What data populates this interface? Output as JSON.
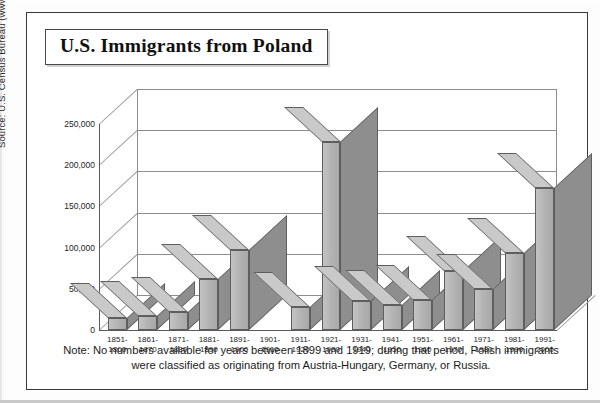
{
  "figure": {
    "title": "U.S. Immigrants from Poland",
    "source": "Source: U.S. Census Bureau (www.census.gov).",
    "note": "Note: No numbers available for years between 1899 and 1919; during that period, Polish immigrants were classified as originating from Austria-Hungary, Germany, or Russia."
  },
  "chart_data": {
    "type": "bar",
    "title": "U.S. Immigrants from Poland",
    "xlabel": "",
    "ylabel": "",
    "ylim": [
      0,
      250000
    ],
    "grid": true,
    "legend": "none",
    "style": "3d-column",
    "ytick_labels": [
      "250,000",
      "200,000",
      "150,000",
      "100,000",
      "50,000",
      "0"
    ],
    "ytick_values": [
      250000,
      200000,
      150000,
      100000,
      50000,
      0
    ],
    "categories": [
      "1851-\n1860",
      "1861-\n1870",
      "1871-\n1880",
      "1881-\n1890",
      "1891-\n1900",
      "1901-\n1910",
      "1911-\n1920",
      "1921-\n1930",
      "1931-\n1940",
      "1941-\n1950",
      "1951-\n1960",
      "1961-\n1970",
      "1971-\n1980",
      "1981-\n1990",
      "1991-\n2000"
    ],
    "category_lines": [
      [
        "1851-",
        "1860"
      ],
      [
        "1861-",
        "1870"
      ],
      [
        "1871-",
        "1880"
      ],
      [
        "1881-",
        "1890"
      ],
      [
        "1891-",
        "1900"
      ],
      [
        "1901-",
        "1910"
      ],
      [
        "1911-",
        "1920"
      ],
      [
        "1921-",
        "1930"
      ],
      [
        "1931-",
        "1940"
      ],
      [
        "1941-",
        "1950"
      ],
      [
        "1951-",
        "1960"
      ],
      [
        "1961-",
        "1970"
      ],
      [
        "1971-",
        "1980"
      ],
      [
        "1981-",
        "1990"
      ],
      [
        "1991-",
        "2000"
      ]
    ],
    "values": [
      14000,
      17000,
      22000,
      62000,
      97000,
      null,
      28000,
      228000,
      35000,
      30000,
      37000,
      72000,
      50000,
      94000,
      172000
    ],
    "missing_categories": [
      "1901-1910"
    ],
    "colors": {
      "bar_front": "#b2b2b2",
      "bar_side": "#8e8e8e",
      "bar_top": "#c9c9c9",
      "bar_outline": "#5e5e5e",
      "gridline": "#8d8d8d",
      "axis": "#5a5a5a",
      "text": "#1a1a1a",
      "background": "#ffffff"
    }
  }
}
